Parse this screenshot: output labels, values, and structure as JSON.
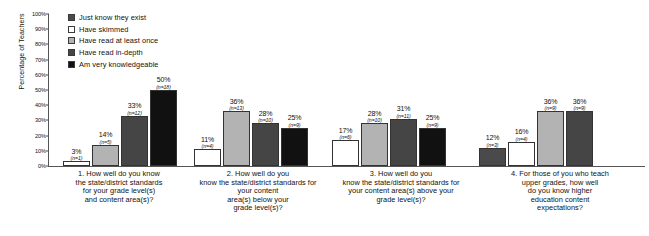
{
  "chart_data": {
    "type": "bar",
    "title": "",
    "xlabel": "",
    "ylabel": "Percentage of Teachers",
    "ylim": [
      0,
      100
    ],
    "ytick_labels": [
      "0%",
      "10%",
      "20%",
      "30%",
      "40%",
      "50%",
      "60%",
      "70%",
      "80%",
      "90%",
      "100%"
    ],
    "ytick_values": [
      0,
      10,
      20,
      30,
      40,
      50,
      60,
      70,
      80,
      90,
      100
    ],
    "grid": false,
    "legend_position": "top-left",
    "categories": [
      "1. How well do you know the state/district standards for your grade level(s) and content area(s)?",
      "2. How well do you know the state/district standards for your content area(s) below your grade level(s)?",
      "3. How well do you know the state/district standards for your content area(s) above your grade level(s)?",
      "4. For those of you who teach upper grades, how well do you know higher education content expectations?"
    ],
    "category_lines": [
      [
        "1. How well do you know",
        "the state/district standards",
        "for your grade level(s)",
        "and content area(s)?"
      ],
      [
        "2. How well do you",
        "know the state/district standards for",
        "your content",
        "area(s) below your",
        "grade level(s)?"
      ],
      [
        "3. How well do you",
        "know the state/district standards for",
        "your content area(s) above your",
        "grade level(s)?"
      ],
      [
        "4. For those of you who teach",
        "upper grades, how well",
        "do you know higher",
        "education content",
        "expectations?"
      ]
    ],
    "series": [
      {
        "name": "Just know they exist",
        "color": "#4a4a4a",
        "values": [
          0,
          0,
          0,
          12
        ],
        "counts": [
          "",
          "",
          "",
          "(n=3)"
        ],
        "labels": [
          "",
          "",
          "",
          "12%"
        ]
      },
      {
        "name": "Have skimmed",
        "color": "#ffffff",
        "values": [
          3,
          11,
          17,
          16
        ],
        "counts": [
          "(n=1)",
          "(n=4)",
          "(n=6)",
          "(n=4)"
        ],
        "labels": [
          "3%",
          "11%",
          "17%",
          "16%"
        ]
      },
      {
        "name": "Have read at least once",
        "color": "#b3b3b3",
        "values": [
          14,
          36,
          28,
          36
        ],
        "counts": [
          "(n=5)",
          "(n=13)",
          "(n=10)",
          "(n=9)"
        ],
        "labels": [
          "14%",
          "36%",
          "28%",
          "36%"
        ]
      },
      {
        "name": "Have read in-depth",
        "color": "#454545",
        "values": [
          33,
          28,
          31,
          36
        ],
        "counts": [
          "(n=12)",
          "(n=10)",
          "(n=11)",
          "(n=9)"
        ],
        "labels": [
          "33%",
          "28%",
          "31%",
          "36%"
        ]
      },
      {
        "name": "Am very knowledgeable",
        "color": "#111111",
        "values": [
          50,
          25,
          25,
          0
        ],
        "counts": [
          "(n=18)",
          "(n=9)",
          "(n=9)",
          ""
        ],
        "labels": [
          "50%",
          "25%",
          "25%",
          ""
        ]
      }
    ]
  }
}
